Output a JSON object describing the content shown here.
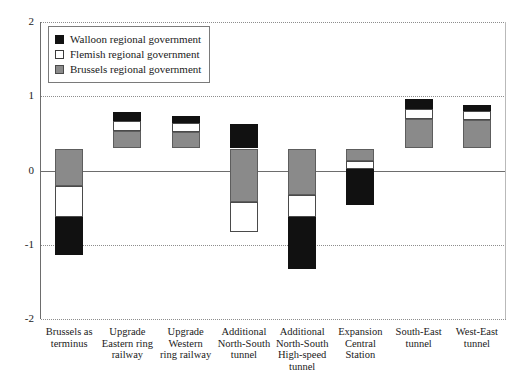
{
  "chart_data": {
    "type": "bar",
    "subtype": "stacked-diverging",
    "title": "",
    "xlabel": "",
    "ylabel": "",
    "ylim": [
      -2,
      2
    ],
    "yticks": [
      "2",
      "1",
      "0",
      "-1",
      "-2"
    ],
    "ytick_values": [
      2,
      1,
      0,
      -1,
      -2
    ],
    "grid": true,
    "legend_position": "top-left",
    "categories": [
      "Brussels as terminus",
      "Upgrade Eastern ring railway",
      "Upgrade Western ring railway",
      "Additional North-South tunnel",
      "Additional North-South High-speed tunnel",
      "Expansion Central Station",
      "South-East tunnel",
      "West-East tunnel"
    ],
    "category_lines": [
      [
        "Brussels as",
        "terminus"
      ],
      [
        "Upgrade",
        "Eastern ring",
        "railway"
      ],
      [
        "Upgrade",
        "Western",
        "ring railway"
      ],
      [
        "Additional",
        "North-South",
        "tunnel"
      ],
      [
        "Additional",
        "North-South",
        "High-speed",
        "tunnel"
      ],
      [
        "Expansion",
        "Central",
        "Station"
      ],
      [
        "South-East",
        "tunnel"
      ],
      [
        "West-East",
        "tunnel"
      ]
    ],
    "series": [
      {
        "name": "Walloon regional government",
        "key": "walloon",
        "color": "#111111",
        "values": [
          -0.51,
          0.12,
          0.09,
          0.33,
          -0.7,
          -0.48,
          0.13,
          0.08
        ]
      },
      {
        "name": "Flemish regional government",
        "key": "flemish",
        "color": "#ffffff",
        "values": [
          -0.42,
          0.13,
          0.13,
          -0.4,
          -0.3,
          -0.11,
          0.13,
          0.13
        ]
      },
      {
        "name": "Brussels regional government",
        "key": "brussels",
        "color": "#8a8a8a",
        "values": [
          -0.5,
          0.24,
          0.22,
          -0.72,
          -0.62,
          -0.17,
          0.4,
          0.38
        ]
      }
    ]
  },
  "legend": {
    "items": [
      {
        "label": "Walloon regional government",
        "key": "walloon"
      },
      {
        "label": "Flemish regional government",
        "key": "flemish"
      },
      {
        "label": "Brussels regional government",
        "key": "brussels"
      }
    ]
  },
  "header": {
    "cropped_text": ""
  }
}
